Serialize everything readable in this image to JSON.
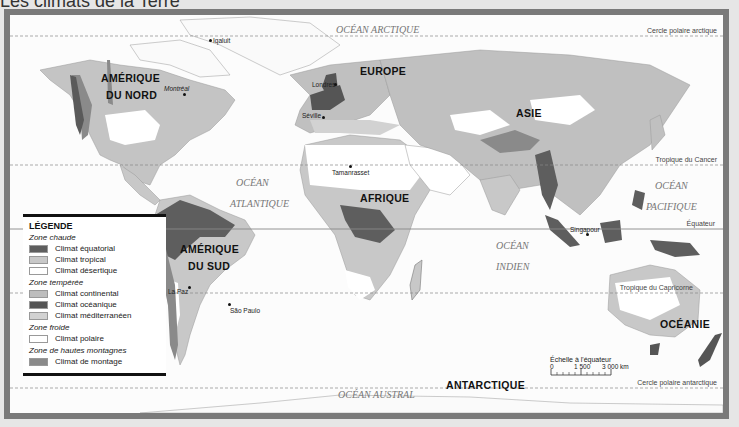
{
  "page": {
    "title": "Les climats de la Terre"
  },
  "map": {
    "lines": {
      "arctic_circle": "Cercle polaire arctique",
      "tropic_cancer": "Tropique du Cancer",
      "equator": "Équateur",
      "tropic_capricorn": "Tropique du Capricorne",
      "antarctic_circle": "Cercle polaire antarctique"
    },
    "continents": {
      "north_america_1": "AMÉRIQUE",
      "north_america_2": "DU NORD",
      "south_america_1": "AMÉRIQUE",
      "south_america_2": "DU SUD",
      "europe": "EUROPE",
      "asia": "ASIE",
      "africa": "AFRIQUE",
      "oceania": "OCÉANIE",
      "antarctica": "ANTARCTIQUE"
    },
    "oceans": {
      "arctic": "OCÉAN ARCTIQUE",
      "atlantic_1": "OCÉAN",
      "atlantic_2": "ATLANTIQUE",
      "indian_1": "OCÉAN",
      "indian_2": "INDIEN",
      "pacific_1": "OCÉAN",
      "pacific_2": "PACIFIQUE",
      "southern": "OCÉAN AUSTRAL"
    },
    "cities": {
      "iqaluit": "Iqaluit",
      "montreal": "Montréal",
      "londres": "Londres",
      "seville": "Séville",
      "tamanrasset": "Tamanrasset",
      "la_paz": "La Paz",
      "sao_paulo": "São Paulo",
      "singapour": "Singapour"
    },
    "scale": {
      "title": "Échelle à l'équateur",
      "ticks": [
        "0",
        "1 500",
        "3 000 km"
      ]
    }
  },
  "legend": {
    "title": "LÉGENDE",
    "zones": [
      {
        "name": "Zone chaude",
        "items": [
          {
            "label": "Climat équatorial",
            "color": "#5e5e5e"
          },
          {
            "label": "Climat tropical",
            "color": "#c8c8c8"
          },
          {
            "label": "Climat désertique",
            "color": "#ffffff"
          }
        ]
      },
      {
        "name": "Zone tempérée",
        "items": [
          {
            "label": "Climat continental",
            "color": "#bdbdbd"
          },
          {
            "label": "Climat océanique",
            "color": "#555555"
          },
          {
            "label": "Climat méditerranéen",
            "color": "#d2d2d2"
          }
        ]
      },
      {
        "name": "Zone froide",
        "items": [
          {
            "label": "Climat polaire",
            "color": "#ffffff"
          }
        ]
      },
      {
        "name": "Zone de hautes montagnes",
        "items": [
          {
            "label": "Climat de montage",
            "color": "#8a8a8a"
          }
        ]
      }
    ]
  }
}
